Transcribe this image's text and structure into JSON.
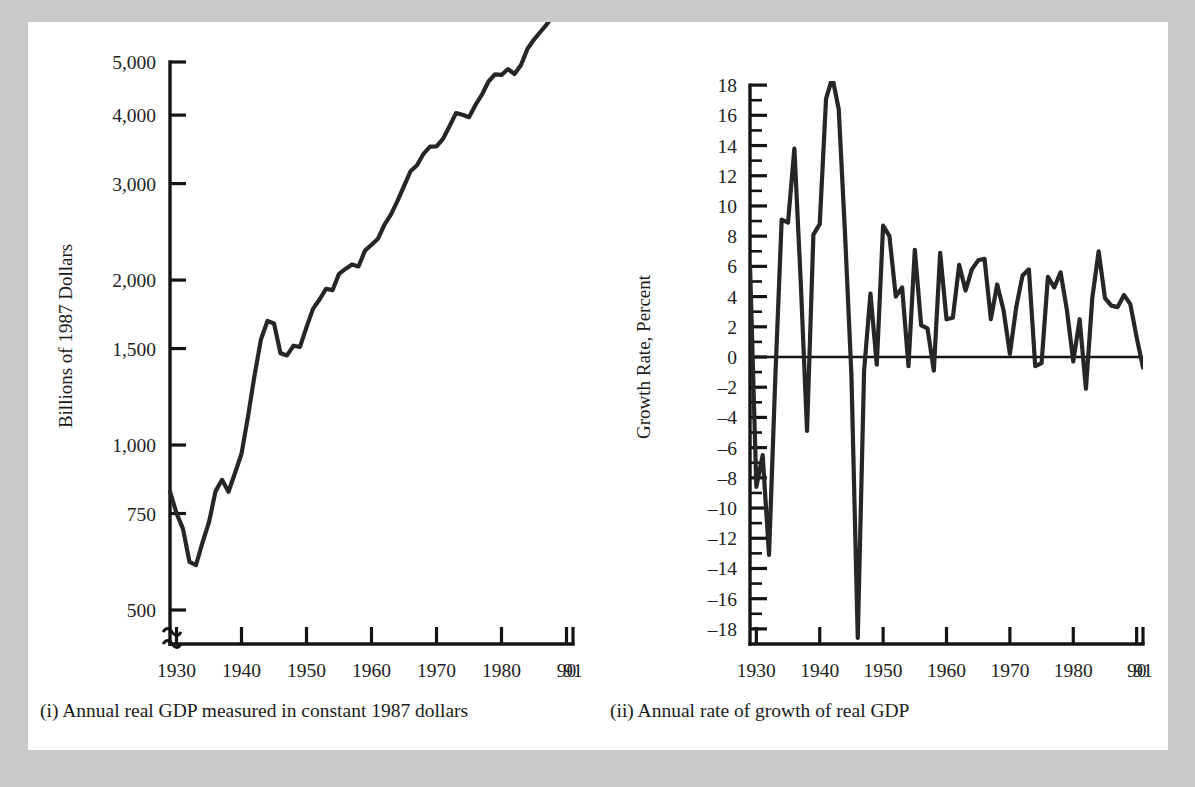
{
  "figure": {
    "background_color": "#c9c9c9",
    "page_color": "#ffffff",
    "ink_color": "#1a1a1a"
  },
  "panels": [
    {
      "id": "left",
      "caption": "(i) Annual real GDP measured in constant 1987 dollars",
      "ylabel": "Billions of 1987 Dollars",
      "xlabel": "",
      "ytick_labels": [
        "5,000",
        "4,000",
        "3,000",
        "2,000",
        "1,500",
        "1,000",
        "750",
        "500"
      ],
      "xtick_labels": [
        "1930",
        "1940",
        "1950",
        "1960",
        "1970",
        "1980",
        "90",
        "91"
      ],
      "axis_break": true
    },
    {
      "id": "right",
      "caption": "(ii) Annual rate of growth of real GDP",
      "ylabel": "Growth Rate, Percent",
      "xlabel": "",
      "ytick_labels": [
        "18",
        "16",
        "14",
        "12",
        "10",
        "8",
        "6",
        "4",
        "2",
        "0",
        "-2",
        "-4",
        "-6",
        "-8",
        "-10",
        "-12",
        "-14",
        "-16",
        "-18"
      ],
      "xtick_labels": [
        "1930",
        "1940",
        "1950",
        "1960",
        "1970",
        "1980",
        "90",
        "91"
      ],
      "axis_break": false
    }
  ],
  "chart_data": [
    {
      "type": "line",
      "id": "real-gdp-level",
      "title": "(i) Annual real GDP measured in constant 1987 dollars",
      "xlabel": "",
      "ylabel": "Billions of 1987 Dollars",
      "yscale": "log",
      "ylim": [
        430,
        5400
      ],
      "xlim": [
        1929,
        1991
      ],
      "yticks": [
        500,
        750,
        1000,
        1500,
        2000,
        3000,
        4000,
        5000
      ],
      "ytick_labels": [
        "500",
        "750",
        "1,000",
        "1,500",
        "2,000",
        "3,000",
        "4,000",
        "5,000"
      ],
      "xticks": [
        1930,
        1940,
        1950,
        1960,
        1970,
        1980,
        1990,
        1991
      ],
      "xtick_labels": [
        "1930",
        "1940",
        "1950",
        "1960",
        "1970",
        "1980",
        "90",
        "91"
      ],
      "grid": false,
      "legend": "none",
      "axis_break_below": 500,
      "x": [
        1929,
        1930,
        1931,
        1932,
        1933,
        1934,
        1935,
        1936,
        1937,
        1938,
        1939,
        1940,
        1941,
        1942,
        1943,
        1944,
        1945,
        1946,
        1947,
        1948,
        1949,
        1950,
        1951,
        1952,
        1953,
        1954,
        1955,
        1956,
        1957,
        1958,
        1959,
        1960,
        1961,
        1962,
        1963,
        1964,
        1965,
        1966,
        1967,
        1968,
        1969,
        1970,
        1971,
        1972,
        1973,
        1974,
        1975,
        1976,
        1977,
        1978,
        1979,
        1980,
        1981,
        1982,
        1983,
        1984,
        1985,
        1986,
        1987,
        1988,
        1989,
        1990,
        1991
      ],
      "values": [
        822,
        751,
        703,
        612,
        604,
        664,
        723,
        823,
        864,
        822,
        889,
        964,
        1127,
        1339,
        1560,
        1684,
        1667,
        1471,
        1457,
        1518,
        1510,
        1641,
        1772,
        1843,
        1928,
        1917,
        2053,
        2096,
        2136,
        2118,
        2263,
        2320,
        2380,
        2525,
        2636,
        2789,
        2967,
        3159,
        3240,
        3400,
        3504,
        3506,
        3620,
        3816,
        4033,
        4006,
        3965,
        4175,
        4362,
        4606,
        4748,
        4735,
        4854,
        4754,
        4938,
        5285,
        5494,
        5678,
        5863,
        6102,
        6315,
        6394,
        6352
      ],
      "note": "values plotted in billions of 1987 dollars on a ratio (log) scale; curve runs ~822 in 1929, trough ~604 in 1933, wartime peak ~1684 in 1944, postwar dip ~1457 in 1947, steady rise to ~4900 by 1991"
    },
    {
      "type": "line",
      "id": "real-gdp-growth-rate",
      "title": "(ii) Annual rate of growth of real GDP",
      "xlabel": "",
      "ylabel": "Growth Rate, Percent",
      "yscale": "linear",
      "ylim": [
        -19,
        19
      ],
      "xlim": [
        1929,
        1991
      ],
      "yticks": [
        18,
        16,
        14,
        12,
        10,
        8,
        6,
        4,
        2,
        0,
        -2,
        -4,
        -6,
        -8,
        -10,
        -12,
        -14,
        -16,
        -18
      ],
      "minor_tick_step": 1,
      "xticks": [
        1930,
        1940,
        1950,
        1960,
        1970,
        1980,
        1990,
        1991
      ],
      "xtick_labels": [
        "1930",
        "1940",
        "1950",
        "1960",
        "1970",
        "1980",
        "90",
        "91"
      ],
      "grid": false,
      "legend": "none",
      "zero_line": true,
      "x": [
        1929,
        1930,
        1931,
        1932,
        1933,
        1934,
        1935,
        1936,
        1937,
        1938,
        1939,
        1940,
        1941,
        1942,
        1943,
        1944,
        1945,
        1946,
        1947,
        1948,
        1949,
        1950,
        1951,
        1952,
        1953,
        1954,
        1955,
        1956,
        1957,
        1958,
        1959,
        1960,
        1961,
        1962,
        1963,
        1964,
        1965,
        1966,
        1967,
        1968,
        1969,
        1970,
        1971,
        1972,
        1973,
        1974,
        1975,
        1976,
        1977,
        1978,
        1979,
        1980,
        1981,
        1982,
        1983,
        1984,
        1985,
        1986,
        1987,
        1988,
        1989,
        1990,
        1991
      ],
      "values": [
        6.1,
        -8.6,
        -6.5,
        -13.1,
        -1.3,
        9.1,
        8.9,
        13.8,
        5.0,
        -4.9,
        8.1,
        8.8,
        17.1,
        18.5,
        16.4,
        8.1,
        -1.2,
        -18.6,
        -0.9,
        4.2,
        -0.5,
        8.7,
        8.0,
        4.0,
        4.6,
        -0.6,
        7.1,
        2.1,
        1.9,
        -0.9,
        6.9,
        2.5,
        2.6,
        6.1,
        4.4,
        5.8,
        6.4,
        6.5,
        2.5,
        4.8,
        3.1,
        0.2,
        3.3,
        5.4,
        5.8,
        -0.6,
        -0.4,
        5.3,
        4.6,
        5.6,
        3.1,
        -0.3,
        2.5,
        -2.1,
        3.9,
        7.0,
        3.9,
        3.4,
        3.3,
        4.1,
        3.5,
        1.3,
        -0.7
      ],
      "note": "annual percentage growth of real GDP; deep Depression contractions 1930-1933, wartime boom peaking 18.5% in 1943, 1946 demobilization trough near -18.6%, postwar fluctuations mostly between -2% and +7%"
    }
  ]
}
